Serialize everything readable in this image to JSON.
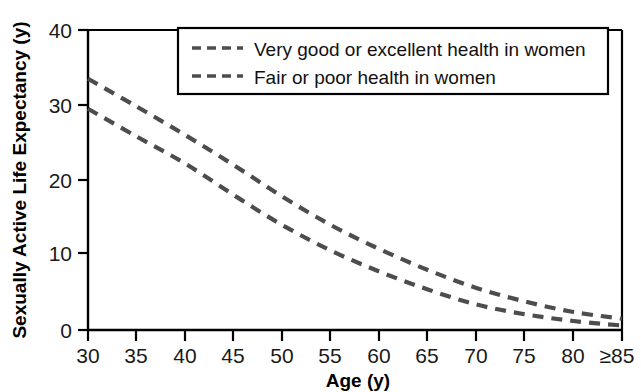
{
  "chart_data": {
    "type": "line",
    "title": "",
    "xlabel": "Age (y)",
    "ylabel": "Sexually Active Life Expectancy (y)",
    "xlim": [
      30,
      85
    ],
    "ylim": [
      0,
      40
    ],
    "grid": false,
    "legend_position": "top-center",
    "x": [
      30,
      35,
      40,
      45,
      50,
      55,
      60,
      65,
      70,
      75,
      80,
      85
    ],
    "xtick_labels": [
      "30",
      "35",
      "40",
      "45",
      "50",
      "55",
      "60",
      "65",
      "70",
      "75",
      "80",
      "≥85"
    ],
    "ytick_labels": [
      "0",
      "10",
      "20",
      "30",
      "40"
    ],
    "ytick_values": [
      0,
      10,
      20,
      30,
      40
    ],
    "series": [
      {
        "name": "Very good or excellent health in women",
        "color": "#4d4d4d",
        "dash": "dashed",
        "values": [
          33.5,
          29.8,
          26.0,
          22.0,
          17.8,
          14.0,
          10.8,
          8.0,
          5.6,
          3.8,
          2.4,
          1.5
        ]
      },
      {
        "name": "Fair or poor health in women",
        "color": "#4d4d4d",
        "dash": "dashed",
        "values": [
          29.5,
          25.8,
          22.2,
          18.0,
          14.0,
          10.6,
          7.8,
          5.4,
          3.4,
          2.1,
          1.2,
          0.6
        ]
      }
    ]
  },
  "legend": {
    "items": [
      {
        "label": "Very good or excellent health in women"
      },
      {
        "label": "Fair or poor health in women"
      }
    ]
  },
  "axes": {
    "x_title": "Age (y)",
    "y_title": "Sexually Active Life Expectancy (y)"
  },
  "colors": {
    "axis": "#000000",
    "line": "#4d4d4d",
    "text": "#000000",
    "background": "#ffffff"
  }
}
